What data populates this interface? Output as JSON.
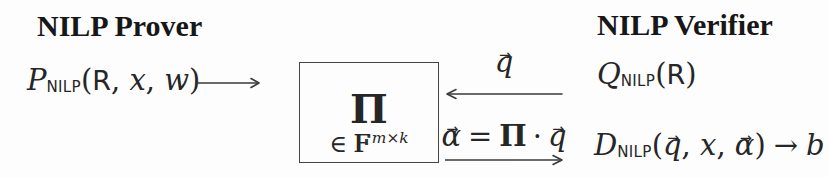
{
  "canvas": {
    "background": "#fdfdfd",
    "ink": "#262626"
  },
  "prover": {
    "heading": "NILP Prover",
    "call": {
      "letter": "P",
      "subscript": "NILP",
      "lparen": "(",
      "relation": "R",
      "sep1": ", ",
      "statement": "x",
      "sep2": ", ",
      "witness": "w",
      "rparen": ")"
    }
  },
  "verifier": {
    "heading": "NILP Verifier",
    "query_call": {
      "letter": "Q",
      "subscript": "NILP",
      "lparen": "(",
      "relation": "R",
      "rparen": ")"
    },
    "decision_call": {
      "letter": "D",
      "subscript": "NILP",
      "lparen": "(",
      "query_vec": "q",
      "sep1": ", ",
      "statement": "x",
      "sep2": ", ",
      "answer_vec": "α",
      "rparen": ")",
      "maps_to": "→",
      "output": "b"
    }
  },
  "proof_box": {
    "matrix_symbol": "Π",
    "membership": {
      "element_of": "∈",
      "field_letter": "F",
      "dim_m": "m",
      "dim_times": "×",
      "dim_k": "k"
    }
  },
  "messages": {
    "query": {
      "vector": "q"
    },
    "response": {
      "answer_vec": "α",
      "equals": "=",
      "matrix": "Π",
      "dot": "·",
      "query_vec": "q"
    }
  },
  "symbols": {
    "vector_arrow": "→"
  }
}
